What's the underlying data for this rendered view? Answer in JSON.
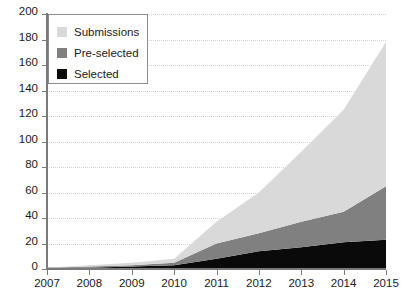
{
  "chart_data": {
    "type": "area",
    "stacked": true,
    "title": "",
    "xlabel": "",
    "ylabel": "",
    "categories": [
      "2007",
      "2008",
      "2009",
      "2010",
      "2011",
      "2012",
      "2013",
      "2014",
      "2015"
    ],
    "x": [
      2007,
      2008,
      2009,
      2010,
      2011,
      2012,
      2013,
      2014,
      2015
    ],
    "xlim": [
      2007,
      2015
    ],
    "ylim": [
      0,
      200
    ],
    "ytick_labels": [
      "0",
      "20",
      "40",
      "60",
      "80",
      "100",
      "120",
      "140",
      "160",
      "180",
      "200"
    ],
    "ytick_values": [
      0,
      20,
      40,
      60,
      80,
      100,
      120,
      140,
      160,
      180,
      200
    ],
    "grid": true,
    "grid_style": "dotted-horizontal",
    "legend_position": "top-left",
    "series": [
      {
        "name": "Selected",
        "color": "#0a0a0a",
        "values": [
          1,
          1,
          2,
          3,
          8,
          14,
          17,
          21,
          23
        ]
      },
      {
        "name": "Pre-selected",
        "color": "#808080",
        "values": [
          0,
          1,
          1,
          2,
          12,
          14,
          20,
          24,
          42
        ]
      },
      {
        "name": "Submissions",
        "color": "#d9d9d9",
        "values": [
          0,
          1,
          2,
          3,
          17,
          32,
          55,
          80,
          113
        ]
      }
    ],
    "series_totals": [
      1,
      3,
      5,
      8,
      37,
      60,
      92,
      125,
      178
    ],
    "legend_entries": [
      {
        "label": "Submissions",
        "color": "#d9d9d9"
      },
      {
        "label": "Pre-selected",
        "color": "#808080"
      },
      {
        "label": "Selected",
        "color": "#0a0a0a"
      }
    ]
  },
  "colors": {
    "axis": "#7a7a7a",
    "grid": "#d2d2d2",
    "text": "#1a1a1a",
    "background": "#ffffff",
    "legend_border": "#8c8c8c"
  }
}
